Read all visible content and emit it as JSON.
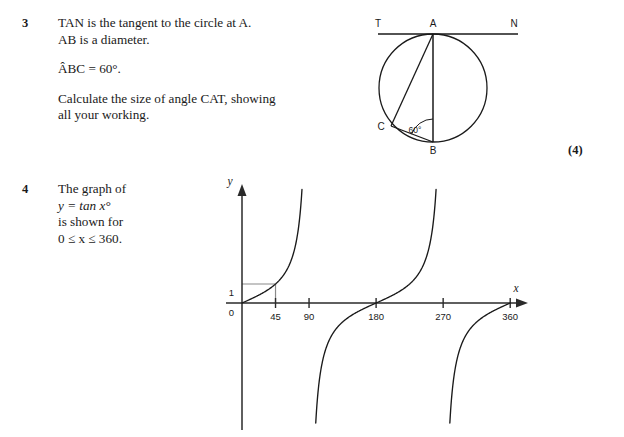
{
  "page": {
    "width": 624,
    "height": 437,
    "background": "#ffffff",
    "ink": "#1a1a1a"
  },
  "questions": [
    {
      "number": "3",
      "lines": [
        "TAN is the tangent to the circle at A.",
        "AB is a diameter.",
        "ÂBC = 60°.",
        "Calculate the size of angle CAT, showing",
        "all your working."
      ],
      "marks": "(4)",
      "figure": {
        "type": "circle-theorem-diagram",
        "points": {
          "T": "T",
          "A": "A",
          "N": "N",
          "B": "B",
          "C": "C"
        },
        "angle_label": "60°",
        "angle_vertex": "B",
        "tangent_line": "TAN",
        "diameter": "AB",
        "chords": [
          "AC",
          "BC"
        ]
      }
    },
    {
      "number": "4",
      "lines": [
        "The graph of",
        "y = tan x°",
        "is shown for",
        "0 ≤ x ≤ 360."
      ],
      "marks": "",
      "figure": {
        "type": "tan-graph"
      }
    }
  ],
  "chart_data": {
    "type": "line",
    "title": "",
    "subtitle": "",
    "function": "y = tan x°",
    "xlabel": "x",
    "ylabel": "y",
    "xlim": [
      0,
      375
    ],
    "ylim": [
      -7,
      7
    ],
    "grid": false,
    "legend": null,
    "x_tick_labels": [
      "0",
      "45",
      "90",
      "180",
      "270",
      "360"
    ],
    "x_tick_values": [
      0,
      45,
      90,
      180,
      270,
      360
    ],
    "y_tick_labels": [
      "0",
      "1"
    ],
    "y_tick_values": [
      0,
      1
    ],
    "asymptotes": [
      90,
      270
    ],
    "guide_lines": [
      {
        "from": [
          0,
          1
        ],
        "to": [
          45,
          1
        ],
        "color": "#8a8a8a"
      },
      {
        "from": [
          45,
          1
        ],
        "to": [
          45,
          0
        ],
        "color": "#8a8a8a"
      }
    ],
    "branches": [
      {
        "domain": [
          0,
          90
        ],
        "note": "rises from 0 through (45,1) to +infinity"
      },
      {
        "domain": [
          90,
          270
        ],
        "note": "rises from -infinity through (180,0) to +infinity"
      },
      {
        "domain": [
          270,
          360
        ],
        "note": "rises from -infinity to 0 at 360"
      }
    ],
    "annotations": [
      {
        "text": "1",
        "at": [
          0,
          1
        ],
        "desc": "y-value one marked on vertical axis"
      },
      {
        "text": "0",
        "at": [
          0,
          0
        ],
        "desc": "origin label"
      }
    ]
  }
}
